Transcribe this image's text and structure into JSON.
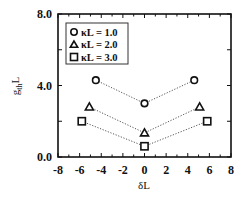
{
  "chart_data": {
    "type": "scatter",
    "title": "",
    "xlabel": "δL",
    "ylabel": "g_th L",
    "xlim": [
      -8,
      8
    ],
    "ylim": [
      0,
      8
    ],
    "xticks": [
      -8,
      -6,
      -4,
      -2,
      0,
      2,
      4,
      6,
      8
    ],
    "xtick_labels": [
      "-8",
      "-6",
      "-4",
      "-2",
      "0",
      "2",
      "4",
      "6",
      "8"
    ],
    "yticks": [
      0,
      4,
      8
    ],
    "ytick_labels": [
      "0.0",
      "4.0",
      "8.0"
    ],
    "grid": false,
    "legend_position": "upper-left inside",
    "series": [
      {
        "name": "κL = 1.0",
        "marker": "circle",
        "line": "dotted",
        "x": [
          -4.5,
          0.0,
          4.6
        ],
        "y": [
          4.3,
          3.0,
          4.3
        ]
      },
      {
        "name": "κL = 2.0",
        "marker": "triangle",
        "line": "dotted",
        "x": [
          -5.1,
          0.0,
          5.1
        ],
        "y": [
          2.8,
          1.35,
          2.8
        ]
      },
      {
        "name": "κL = 3.0",
        "marker": "square",
        "line": "dotted",
        "x": [
          -5.8,
          0.0,
          5.8
        ],
        "y": [
          2.0,
          0.6,
          2.0
        ]
      }
    ]
  },
  "legend": {
    "items": [
      {
        "label": "κL = 1.0",
        "marker": "circle-icon"
      },
      {
        "label": "κL = 2.0",
        "marker": "triangle-icon"
      },
      {
        "label": "κL = 3.0",
        "marker": "square-icon"
      }
    ]
  },
  "axes": {
    "x_title": "δL",
    "y_title_main": "g",
    "y_title_sub": "th",
    "y_title_tail": "L"
  },
  "colors": {
    "ink": "#111111",
    "background": "#ffffff"
  }
}
